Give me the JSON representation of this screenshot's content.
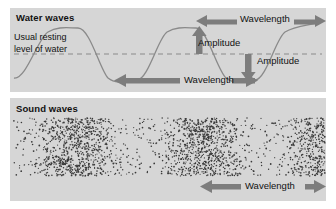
{
  "figure": {
    "title_water": "Water waves",
    "title_sound": "Sound waves",
    "resting_line_label_line1": "Usual resting",
    "resting_line_label_line2": "level of water",
    "labels": {
      "wavelength_top": "Wavelength",
      "amplitude_up": "Amplitude",
      "amplitude_down": "Amplitude",
      "wavelength_mid": "Wavelength",
      "wavelength_bottom": "Wavelength"
    },
    "colors": {
      "panel_background": "#d6d6d6",
      "page_background": "#ffffff",
      "arrow_gray": "#7d7d7d",
      "wave_stroke": "#8a8a8a",
      "dash_stroke": "#8a8a8a",
      "text": "#111111",
      "dot": "#3a3a3a"
    },
    "water_wave": {
      "type": "sine",
      "wavelength_px": 118,
      "amplitude_px": 26,
      "resting_level_y": 54,
      "crest_xs": [
        78,
        196
      ],
      "trough_xs": [
        19,
        137,
        255
      ]
    },
    "sound_wave": {
      "compression_centers_x": [
        78,
        204,
        324
      ],
      "wavelength_px": 124,
      "band_top": 118,
      "band_bottom": 176
    }
  }
}
